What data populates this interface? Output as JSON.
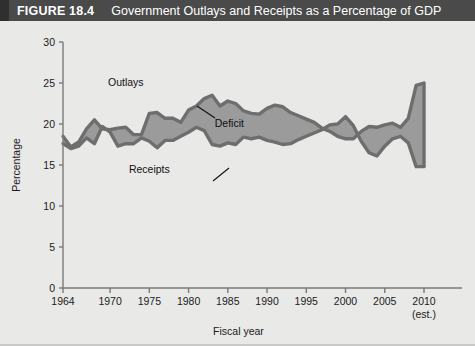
{
  "header": {
    "figure_number": "FIGURE 18.4",
    "title": "Government Outlays and Receipts as a Percentage of GDP",
    "banner_color": "#4a4a4a",
    "text_color": "#ffffff"
  },
  "colors": {
    "background": "#e9e9e7",
    "fill": "#9b9b9b",
    "line": "#6e6e6e",
    "axis": "#7a7a7a",
    "text": "#1b1b1b"
  },
  "annotations": [
    {
      "name": "outlays-label",
      "text": "Outlays",
      "x": 1972.0,
      "y": 24.6
    },
    {
      "name": "deficit-label",
      "text": "Deficit",
      "x": 1985.2,
      "y": 19.6
    },
    {
      "name": "receipts-label",
      "text": "Receipts",
      "x": 1975.0,
      "y": 14.0
    }
  ],
  "chart_data": {
    "type": "area",
    "title": "Government Outlays and Receipts as a Percentage of GDP",
    "xlabel": "Fiscal year",
    "ylabel": "Percentage",
    "xlim": [
      1964,
      2010
    ],
    "ylim": [
      0,
      30
    ],
    "yticks": [
      0,
      5,
      10,
      15,
      20,
      25,
      30
    ],
    "xticks": [
      1964,
      1970,
      1975,
      1980,
      1985,
      1990,
      1995,
      2000,
      2005,
      2010
    ],
    "xtick_labels": [
      "1964",
      "1970",
      "1975",
      "1980",
      "1985",
      "1990",
      "1995",
      "2000",
      "2005",
      "2010"
    ],
    "xtick_note": "(est.)",
    "grid": false,
    "legend": "inline-annotations",
    "x": [
      1964,
      1965,
      1966,
      1967,
      1968,
      1969,
      1970,
      1971,
      1972,
      1973,
      1974,
      1975,
      1976,
      1977,
      1978,
      1979,
      1980,
      1981,
      1982,
      1983,
      1984,
      1985,
      1986,
      1987,
      1988,
      1989,
      1990,
      1991,
      1992,
      1993,
      1994,
      1995,
      1996,
      1997,
      1998,
      1999,
      2000,
      2001,
      2002,
      2003,
      2004,
      2005,
      2006,
      2007,
      2008,
      2009,
      2010
    ],
    "series": [
      {
        "name": "Outlays",
        "values": [
          18.5,
          17.2,
          17.8,
          19.4,
          20.5,
          19.4,
          19.3,
          19.5,
          19.6,
          18.7,
          18.7,
          21.3,
          21.4,
          20.7,
          20.7,
          20.2,
          21.7,
          22.2,
          23.1,
          23.5,
          22.2,
          22.8,
          22.5,
          21.6,
          21.3,
          21.2,
          21.9,
          22.3,
          22.1,
          21.4,
          21.0,
          20.6,
          20.2,
          19.5,
          19.1,
          18.5,
          18.2,
          18.2,
          19.1,
          19.7,
          19.6,
          19.9,
          20.1,
          19.6,
          20.7,
          24.7,
          25.0
        ]
      },
      {
        "name": "Receipts",
        "values": [
          17.6,
          17.0,
          17.3,
          18.3,
          17.6,
          19.7,
          19.0,
          17.3,
          17.6,
          17.6,
          18.3,
          17.9,
          17.1,
          18.0,
          18.0,
          18.5,
          19.0,
          19.6,
          19.2,
          17.5,
          17.3,
          17.7,
          17.5,
          18.4,
          18.2,
          18.4,
          18.0,
          17.8,
          17.5,
          17.6,
          18.1,
          18.5,
          18.9,
          19.3,
          19.9,
          20.0,
          20.9,
          19.8,
          17.9,
          16.5,
          16.1,
          17.3,
          18.2,
          18.5,
          17.7,
          14.8,
          14.8
        ]
      }
    ]
  }
}
